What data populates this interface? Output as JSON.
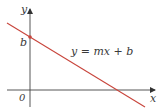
{
  "diagram": {
    "type": "line-graph",
    "axes": {
      "x_label": "x",
      "y_label": "y",
      "origin_label": "0",
      "color": "#333333"
    },
    "line": {
      "equation": "y = mx + b",
      "color": "#c8453c",
      "slope": "negative"
    },
    "intercept": {
      "label": "b",
      "color": "#c8453c"
    }
  }
}
